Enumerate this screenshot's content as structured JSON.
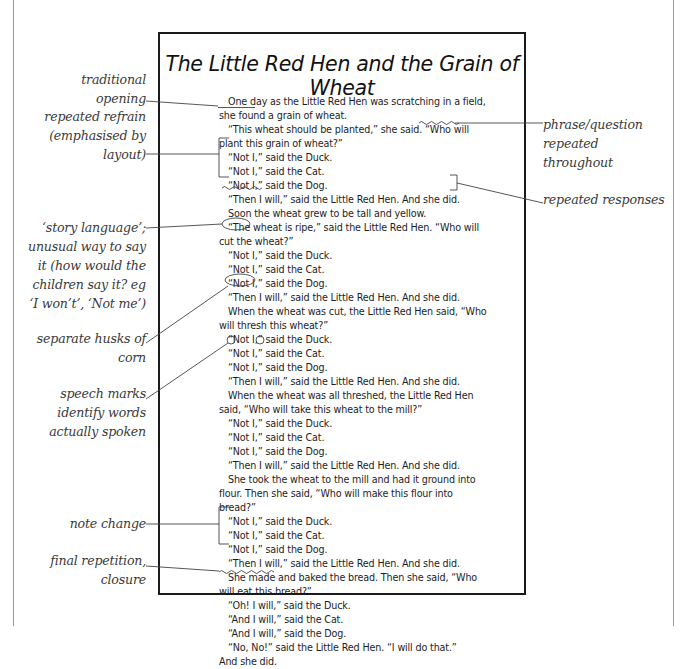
{
  "title": "The Little Red Hen and the Grain of Wheat",
  "story_lines": [
    {
      "text": "One day as the Little Red Hen was scratching in a field,",
      "indent": true
    },
    {
      "text": "she found a grain of wheat.",
      "indent": false
    },
    {
      "text": "“This wheat should be planted,” she said. “Who will",
      "indent": true
    },
    {
      "text": "plant this grain of wheat?”",
      "indent": false
    },
    {
      "text": "“Not I,” said the Duck.",
      "indent": true
    },
    {
      "text": "“Not I,” said the Cat.",
      "indent": true
    },
    {
      "text": "“Not I,” said the Dog.",
      "indent": true
    },
    {
      "text": "“Then I will,” said the Little Red Hen. And she did.",
      "indent": true
    },
    {
      "text": "Soon the wheat grew to be tall and yellow.",
      "indent": true
    },
    {
      "text": "“The wheat is ripe,” said the Little Red Hen. “Who will",
      "indent": true
    },
    {
      "text": "cut the wheat?”",
      "indent": false
    },
    {
      "text": "“Not I,” said the Duck.",
      "indent": true
    },
    {
      "text": "“Not I,” said the Cat.",
      "indent": true
    },
    {
      "text": "“Not I,” said the Dog.",
      "indent": true
    },
    {
      "text": "“Then I will,” said the Little Red Hen. And she did.",
      "indent": true
    },
    {
      "text": "When the wheat was cut, the Little Red Hen said, “Who",
      "indent": true
    },
    {
      "text": "will thresh this wheat?”",
      "indent": false
    },
    {
      "text": "“Not I,” said the Duck.",
      "indent": true
    },
    {
      "text": "“Not I,” said the Cat.",
      "indent": true
    },
    {
      "text": "“Not I,” said the Dog.",
      "indent": true
    },
    {
      "text": "“Then I will,” said the Little Red Hen. And she did.",
      "indent": true
    },
    {
      "text": "When the wheat was all threshed, the Little Red Hen",
      "indent": true
    },
    {
      "text": "said, “Who will take this wheat to the mill?”",
      "indent": false
    },
    {
      "text": "“Not I,” said the Duck.",
      "indent": true
    },
    {
      "text": "“Not I,” said the Cat.",
      "indent": true
    },
    {
      "text": "“Not I,” said the Dog.",
      "indent": true
    },
    {
      "text": "“Then I will,” said the Little Red Hen. And she did.",
      "indent": true
    },
    {
      "text": "She took the wheat to the mill and had it ground into",
      "indent": true
    },
    {
      "text": "flour. Then she said, “Who will make this flour into",
      "indent": false
    },
    {
      "text": "bread?”",
      "indent": false
    },
    {
      "text": "“Not I,” said the Duck.",
      "indent": true
    },
    {
      "text": "“Not I,” said the Cat.",
      "indent": true
    },
    {
      "text": "“Not I,” said the Dog.",
      "indent": true
    },
    {
      "text": "“Then I will,” said the Little Red Hen. And she did.",
      "indent": true
    },
    {
      "text": "She made and baked the bread. Then she said, “Who",
      "indent": true
    },
    {
      "text": "will eat this bread?”",
      "indent": false
    },
    {
      "text": "“Oh! I will,” said the Duck.",
      "indent": true
    },
    {
      "text": "“And I will,” said the Cat.",
      "indent": true
    },
    {
      "text": "“And I will,” said the Dog.",
      "indent": true
    },
    {
      "text": "“No, No!” said the Little Red Hen. “I will do that.”",
      "indent": true
    },
    {
      "text": "And she did.",
      "indent": false
    }
  ],
  "annotations_left": [
    {
      "id": "traditional-opening",
      "lines": [
        "traditional",
        "opening"
      ]
    },
    {
      "id": "repeated-refrain",
      "lines": [
        "repeated refrain",
        "(emphasised by",
        "layout)"
      ]
    },
    {
      "id": "story-language",
      "lines": [
        "‘story language’;",
        "unusual way to say",
        "it (how would the",
        "children say it? eg",
        "‘I won’t’, ‘Not me’)"
      ]
    },
    {
      "id": "separate-husks",
      "lines": [
        "separate husks of",
        "corn"
      ]
    },
    {
      "id": "speech-marks",
      "lines": [
        "speech marks",
        "identify words",
        "actually spoken"
      ]
    },
    {
      "id": "note-change",
      "lines": [
        "note change"
      ]
    },
    {
      "id": "final-repetition",
      "lines": [
        "final repetition,",
        "closure"
      ]
    }
  ],
  "annotations_right": [
    {
      "id": "phrase-question",
      "lines": [
        "phrase/question",
        "repeated",
        "throughout"
      ]
    },
    {
      "id": "repeated-responses",
      "lines": [
        "repeated responses"
      ]
    }
  ]
}
